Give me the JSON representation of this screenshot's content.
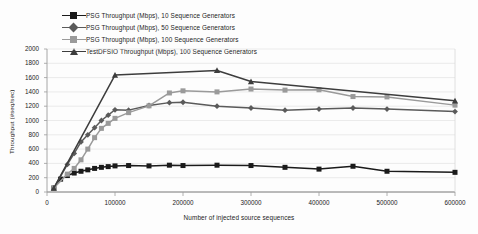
{
  "chart_data": {
    "type": "line",
    "title": "",
    "xlabel": "Number of injected source sequences",
    "ylabel": "Throughput (#seq/sec)",
    "xlim": [
      0,
      600000
    ],
    "ylim": [
      0,
      2000
    ],
    "xticks": [
      0,
      100000,
      200000,
      300000,
      400000,
      500000,
      600000
    ],
    "xtick_labels": [
      "0",
      "100000",
      "200000",
      "300000",
      "400000",
      "500000",
      "600000"
    ],
    "yticks": [
      0,
      200,
      400,
      600,
      800,
      1000,
      1200,
      1400,
      1600,
      1800,
      2000
    ],
    "ytick_labels": [
      "0",
      "200",
      "400",
      "600",
      "800",
      "1000",
      "1200",
      "1400",
      "1600",
      "1800",
      "2000"
    ],
    "grid": true,
    "grid_axis": "y",
    "legend_position": "top-left",
    "series": [
      {
        "name": "PSG Throughput (Mbps), 10 Sequence Generators",
        "marker": "square",
        "color": "#1a1a1a",
        "x": [
          10000,
          20000,
          30000,
          40000,
          50000,
          60000,
          70000,
          80000,
          90000,
          100000,
          120000,
          150000,
          180000,
          200000,
          250000,
          300000,
          350000,
          400000,
          450000,
          500000,
          600000
        ],
        "y": [
          55,
          180,
          230,
          265,
          290,
          310,
          330,
          345,
          355,
          365,
          370,
          365,
          375,
          370,
          375,
          370,
          345,
          320,
          360,
          290,
          275
        ]
      },
      {
        "name": "PSG Throughput (Mbps), 50 Sequence Generators",
        "marker": "diamond",
        "color": "#5a5a5a",
        "x": [
          10000,
          30000,
          40000,
          50000,
          60000,
          70000,
          80000,
          90000,
          100000,
          120000,
          150000,
          180000,
          200000,
          250000,
          300000,
          350000,
          400000,
          450000,
          500000,
          600000
        ],
        "y": [
          55,
          385,
          540,
          700,
          800,
          900,
          1000,
          1075,
          1150,
          1145,
          1210,
          1250,
          1255,
          1200,
          1175,
          1145,
          1160,
          1175,
          1160,
          1125
        ]
      },
      {
        "name": "PSG Throughput (Mbps), 100 Sequence Generators",
        "marker": "square",
        "color": "#9a9a9a",
        "x": [
          10000,
          30000,
          40000,
          50000,
          60000,
          70000,
          80000,
          90000,
          100000,
          120000,
          150000,
          180000,
          200000,
          250000,
          300000,
          350000,
          400000,
          450000,
          500000,
          600000
        ],
        "y": [
          55,
          250,
          330,
          450,
          600,
          760,
          890,
          960,
          1030,
          1110,
          1205,
          1385,
          1415,
          1400,
          1440,
          1425,
          1430,
          1335,
          1330,
          1215
        ]
      },
      {
        "name": "TestDFSIO Throughput (Mbps), 100 Sequence Generators",
        "marker": "triangle",
        "color": "#3d3d3d",
        "x": [
          10000,
          100000,
          250000,
          300000,
          600000
        ],
        "y": [
          55,
          1635,
          1700,
          1545,
          1275
        ]
      }
    ]
  },
  "legend": {
    "items": [
      {
        "label": "PSG Throughput (Mbps), 10 Sequence Generators",
        "marker": "square",
        "color": "#1a1a1a"
      },
      {
        "label": "PSG Throughput (Mbps), 50 Sequence Generators",
        "marker": "diamond",
        "color": "#5a5a5a"
      },
      {
        "label": "PSG Throughput (Mbps), 100 Sequence Generators",
        "marker": "square",
        "color": "#9a9a9a"
      },
      {
        "label": "TestDFSIO Throughput (Mbps), 100 Sequence Generators",
        "marker": "triangle",
        "color": "#3d3d3d"
      }
    ]
  },
  "colors": {
    "grid": "#e2e2e2",
    "axis": "#9c9c9c",
    "text": "#232323",
    "background": "#fdfdfd"
  }
}
